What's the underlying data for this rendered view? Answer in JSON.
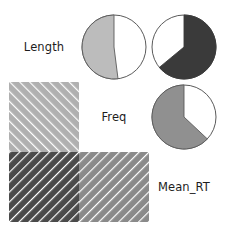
{
  "figure": {
    "type": "correlation-matrix",
    "variables": [
      "Length",
      "Freq",
      "Mean_RT"
    ],
    "labels": {
      "length": "Length",
      "freq": "Freq",
      "mean_rt": "Mean_RT"
    },
    "background_color": "#ffffff",
    "outline_color": "#5a5a5a",
    "stripe_color": "#ffffff"
  },
  "chart_data": {
    "type": "heatmap",
    "title": "",
    "xlabel": "",
    "ylabel": "",
    "categories": [
      "Length",
      "Freq",
      "Mean_RT"
    ],
    "grid": false,
    "legend_position": "none",
    "upper_triangle_encoding": "pie-wedge-fraction",
    "lower_triangle_encoding": "hatched-square",
    "cells": [
      {
        "row": "Length",
        "col": "Freq",
        "position": "upper",
        "shape": "pie",
        "fraction": 0.52,
        "percent_label": "52%",
        "direction": "counterclockwise",
        "start_angle_deg": 0,
        "color": "#bcbcbc",
        "stroke": "#5a5a5a"
      },
      {
        "row": "Length",
        "col": "Mean_RT",
        "position": "upper",
        "shape": "pie",
        "fraction": 0.64,
        "percent_label": "64%",
        "direction": "clockwise",
        "start_angle_deg": 0,
        "color": "#3a3a3a",
        "stroke": "#3a3a3a"
      },
      {
        "row": "Freq",
        "col": "Mean_RT",
        "position": "upper",
        "shape": "pie",
        "fraction": 0.63,
        "percent_label": "63%",
        "direction": "counterclockwise",
        "start_angle_deg": 0,
        "color": "#909090",
        "stroke": "#5a5a5a"
      },
      {
        "row": "Freq",
        "col": "Length",
        "position": "lower",
        "shape": "square",
        "color": "#b0b0b0",
        "hatch_direction": "forward-slash",
        "hatch_spacing": 7,
        "hatch_width": 2.4
      },
      {
        "row": "Mean_RT",
        "col": "Length",
        "position": "lower",
        "shape": "square",
        "color": "#4a4a4a",
        "hatch_direction": "back-slash",
        "hatch_spacing": 7,
        "hatch_width": 2.4
      },
      {
        "row": "Mean_RT",
        "col": "Freq",
        "position": "lower",
        "shape": "square",
        "color": "#8a8a8a",
        "hatch_direction": "back-slash",
        "hatch_spacing": 7,
        "hatch_width": 2.4
      }
    ]
  }
}
